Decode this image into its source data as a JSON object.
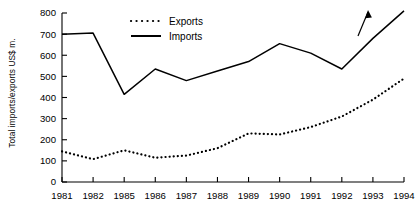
{
  "chart_data": {
    "type": "line",
    "title": "",
    "xlabel": "",
    "ylabel": "Total imports/exports US$ m.",
    "ylim": [
      0,
      800
    ],
    "ytick_step": 100,
    "yticks": [
      "0",
      "100",
      "200",
      "300",
      "400",
      "500",
      "600",
      "700",
      "800"
    ],
    "grid": false,
    "legend_position": "top-center",
    "categories": [
      "1981",
      "1982",
      "1985",
      "1986",
      "1987",
      "1988",
      "1989",
      "1990",
      "1991",
      "1992",
      "1993",
      "1994"
    ],
    "series": [
      {
        "name": "Exports",
        "style": "dotted",
        "values": [
          145,
          108,
          150,
          115,
          125,
          160,
          230,
          225,
          260,
          310,
          390,
          490
        ]
      },
      {
        "name": "Imports",
        "style": "solid",
        "values": [
          700,
          705,
          415,
          535,
          480,
          525,
          570,
          655,
          610,
          535,
          680,
          810
        ]
      }
    ],
    "annotations": [
      {
        "name": "imports-rise-arrow",
        "shape": "arrow",
        "direction": "up-right",
        "near_category": "1993"
      }
    ]
  },
  "legend": {
    "entries": [
      {
        "label": "Exports",
        "style": "dotted"
      },
      {
        "label": "Imports",
        "style": "solid"
      }
    ]
  },
  "axes": {
    "y_title": "Total imports/exports US$ m."
  }
}
